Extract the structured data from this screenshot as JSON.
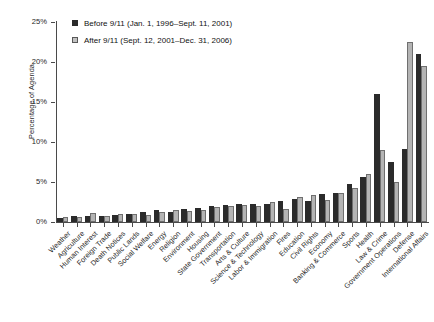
{
  "chart_data": {
    "type": "bar",
    "title": "",
    "xlabel": "",
    "ylabel": "Percentage of Agenda",
    "ylim": [
      0,
      25
    ],
    "ytick_labels": [
      "0%",
      "5%",
      "10%",
      "15%",
      "20%",
      "25%"
    ],
    "ytick_values": [
      0,
      5,
      10,
      15,
      20,
      25
    ],
    "grid": false,
    "legend_position": "top-left",
    "categories": [
      "Weather",
      "Agriculture",
      "Human Interest",
      "Foreign Trade",
      "Death Notices",
      "Public Lands",
      "Social Welfare",
      "Energy",
      "Religion",
      "Environment",
      "Housing",
      "State Government",
      "Transportation",
      "Arts & Culture",
      "Science & Technology",
      "Labor & Immigration",
      "Fires",
      "Education",
      "Civil Rights",
      "Economy",
      "Banking & Commerce",
      "Sports",
      "Health",
      "Law & Crime",
      "Government Operations",
      "Defense",
      "International Affairs"
    ],
    "series": [
      {
        "name": "Before 9/11 (Jan. 1, 1996–Sept. 11, 2001)",
        "color": "#2b2b2b",
        "values": [
          0.5,
          0.7,
          0.8,
          0.8,
          0.9,
          1.0,
          1.2,
          1.5,
          1.3,
          1.6,
          1.7,
          2.0,
          2.1,
          2.2,
          2.3,
          2.2,
          2.6,
          2.9,
          2.6,
          3.5,
          3.6,
          4.8,
          5.6,
          16.0,
          7.5,
          9.1,
          21.0
        ]
      },
      {
        "name": "After 9/11 (Sept. 12, 2001–Dec. 31, 2006)",
        "color": "#b4b4b4",
        "values": [
          0.6,
          0.6,
          1.1,
          0.7,
          1.0,
          1.0,
          0.9,
          1.3,
          1.5,
          1.4,
          1.5,
          1.9,
          2.0,
          2.1,
          2.0,
          2.5,
          1.6,
          3.1,
          3.4,
          2.7,
          3.6,
          4.3,
          6.0,
          9.0,
          5.0,
          22.5,
          19.5
        ]
      }
    ]
  },
  "legend": {
    "entries": [
      {
        "label": "Before 9/11 (Jan. 1, 1996–Sept. 11, 2001)",
        "swatch": "filled-black-square"
      },
      {
        "label": "After 9/11 (Sept. 12, 2001–Dec. 31, 2006)",
        "swatch": "outlined-gray-square"
      }
    ]
  },
  "axes": {
    "y_title": "Percentage of Agenda"
  }
}
